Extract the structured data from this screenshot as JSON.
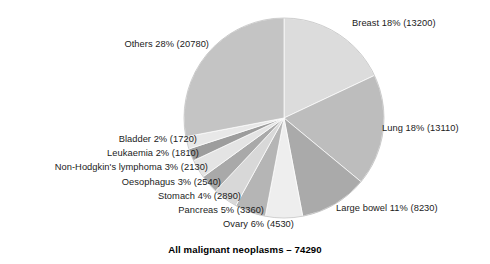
{
  "chart_data": {
    "type": "pie",
    "title": "",
    "caption": "All malignant neoplasms – 74290",
    "total": 74290,
    "units": "cases",
    "start_angle_deg": 0,
    "direction": "clockwise",
    "legend": "none (direct labels)",
    "grid": false,
    "categories": [
      "Breast",
      "Lung",
      "Large bowel",
      "Ovary",
      "Pancreas",
      "Stomach",
      "Oesophagus",
      "Non-Hodgkin's lymphoma",
      "Leukaemia",
      "Bladder",
      "Others"
    ],
    "values": [
      13200,
      13110,
      8230,
      4530,
      3360,
      2890,
      2540,
      2130,
      1810,
      1720,
      20780
    ],
    "percents": [
      18,
      18,
      11,
      6,
      5,
      4,
      3,
      3,
      2,
      2,
      28
    ],
    "slices": [
      {
        "label": "Breast 18% (13200)",
        "name": "Breast",
        "percent": 18,
        "value": 13200,
        "color": "#dcdcdc"
      },
      {
        "label": "Lung 18% (13110)",
        "name": "Lung",
        "percent": 18,
        "value": 13110,
        "color": "#bdbdbd"
      },
      {
        "label": "Large bowel 11% (8230)",
        "name": "Large bowel",
        "percent": 11,
        "value": 8230,
        "color": "#aaaaaa"
      },
      {
        "label": "Ovary 6% (4530)",
        "name": "Ovary",
        "percent": 6,
        "value": 4530,
        "color": "#eeeeee"
      },
      {
        "label": "Pancreas 5% (3360)",
        "name": "Pancreas",
        "percent": 5,
        "value": 3360,
        "color": "#b5b5b5"
      },
      {
        "label": "Stomach 4% (2890)",
        "name": "Stomach",
        "percent": 4,
        "value": 2890,
        "color": "#d8d8d8"
      },
      {
        "label": "Oesophagus 3% (2540)",
        "name": "Oesophagus",
        "percent": 3,
        "value": 2540,
        "color": "#a9a9a9"
      },
      {
        "label": "Non-Hodgkin's lymphoma 3% (2130)",
        "name": "Non-Hodgkin's lymphoma",
        "percent": 3,
        "value": 2130,
        "color": "#e4e4e4"
      },
      {
        "label": "Leukaemia 2% (1810)",
        "name": "Leukaemia",
        "percent": 2,
        "value": 1810,
        "color": "#9d9d9d"
      },
      {
        "label": "Bladder 2% (1720)",
        "name": "Bladder",
        "percent": 2,
        "value": 1720,
        "color": "#e8e8e8"
      },
      {
        "label": "Others 28% (20780)",
        "name": "Others",
        "percent": 28,
        "value": 20780,
        "color": "#c4c4c4"
      }
    ]
  },
  "labels": {
    "breast": "Breast 18% (13200)",
    "lung": "Lung 18% (13110)",
    "large_bowel": "Large bowel 11% (8230)",
    "ovary": "Ovary 6% (4530)",
    "pancreas": "Pancreas 5% (3360)",
    "stomach": "Stomach 4% (2890)",
    "oesophagus": "Oesophagus 3% (2540)",
    "non_hodgkins": "Non-Hodgkin's lymphoma 3% (2130)",
    "leukaemia": "Leukaemia 2% (1810)",
    "bladder": "Bladder 2% (1720)",
    "others": "Others 28% (20780)"
  },
  "caption": "All malignant neoplasms – 74290",
  "colors": {
    "background": "#ffffff",
    "text": "#1b1b1b",
    "slice_light": "#eeeeee",
    "slice_mid": "#c4c4c4",
    "slice_dark": "#9d9d9d"
  }
}
